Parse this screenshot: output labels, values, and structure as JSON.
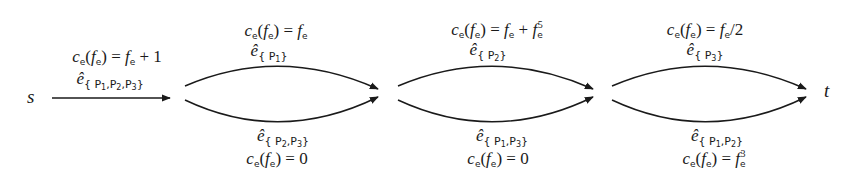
{
  "nodes": {
    "source": "s",
    "sink": "t"
  },
  "edges": [
    {
      "id": "e-P1P2P3",
      "position": "single",
      "edge_symbol": "ê",
      "set_label": "{P1,P2,P3}",
      "set_parts": [
        "P",
        "1",
        ",",
        "P",
        "2",
        ",",
        "P",
        "3"
      ],
      "cost_lhs": "c",
      "cost_text": "ce(fe) = fe + 1",
      "cost_rhs": "fe + 1"
    },
    {
      "id": "e-P1",
      "position": "group1-top",
      "edge_symbol": "ê",
      "set_label": "{P1}",
      "cost_text": "ce(fe) = fe",
      "cost_rhs": "fe"
    },
    {
      "id": "e-P2P3",
      "position": "group1-bottom",
      "edge_symbol": "ê",
      "set_label": "{P2,P3}",
      "cost_text": "ce(fe) = 0",
      "cost_rhs": "0"
    },
    {
      "id": "e-P2",
      "position": "group2-top",
      "edge_symbol": "ê",
      "set_label": "{P2}",
      "cost_text": "ce(fe) = fe + fe^5",
      "cost_rhs": "fe + fe^5"
    },
    {
      "id": "e-P1P3",
      "position": "group2-bottom",
      "edge_symbol": "ê",
      "set_label": "{P1,P3}",
      "cost_text": "ce(fe) = 0",
      "cost_rhs": "0"
    },
    {
      "id": "e-P3",
      "position": "group3-top",
      "edge_symbol": "ê",
      "set_label": "{P3}",
      "cost_text": "ce(fe) = fe/2",
      "cost_rhs": "fe/2"
    },
    {
      "id": "e-P1P2",
      "position": "group3-bottom",
      "edge_symbol": "ê",
      "set_label": "{P1,P2}",
      "cost_text": "ce(fe) = fe^3",
      "cost_rhs": "fe^3"
    }
  ],
  "glyphs": {
    "c": "c",
    "f": "f",
    "e_sub": "e",
    "eq": "=",
    "plus": "+",
    "lparen": "(",
    "rparen": ")",
    "one": "1",
    "zero": "0",
    "two": "2",
    "slash": "/",
    "five": "5",
    "three": "3",
    "ehat": "ê",
    "lbrace": "{",
    "rbrace": "}",
    "P": "P",
    "comma": ",",
    "n1": "1",
    "n2": "2",
    "n3": "3"
  },
  "colors": {
    "stroke": "#1a1a1a",
    "background": "#ffffff"
  }
}
